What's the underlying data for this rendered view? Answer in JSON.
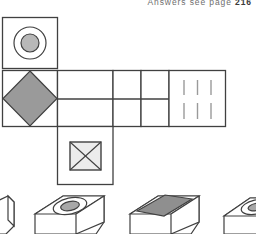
{
  "header": {
    "answer_key_text": "Answers  see  page",
    "answer_key_page": "216"
  },
  "puzzle": {
    "type": "cube-net-folding",
    "net": {
      "description": "Unfolded cube net made of squares on a grid",
      "stroke_color": "#404040",
      "cells": [
        {
          "id": "top-square",
          "data_name": "net-cell-circles",
          "x": 2,
          "y": 17,
          "w": 56,
          "h": 51,
          "face_symbol": "concentric-circles",
          "symbol_fill": "#b8b8b8"
        },
        {
          "id": "left-square",
          "data_name": "net-cell-diamond",
          "x": 2,
          "y": 70,
          "w": 56,
          "h": 57,
          "face_symbol": "filled-diamond",
          "symbol_fill": "#9a9a9a"
        },
        {
          "id": "mid-wide-1",
          "data_name": "net-cell-blank-wide",
          "x": 58,
          "y": 70,
          "w": 55,
          "h": 57,
          "face_symbol": "blank",
          "symbol_fill": "none"
        },
        {
          "id": "mid-2",
          "data_name": "net-cell-blank-a",
          "x": 113,
          "y": 70,
          "w": 28,
          "h": 57,
          "face_symbol": "blank",
          "symbol_fill": "none"
        },
        {
          "id": "mid-3",
          "data_name": "net-cell-blank-b",
          "x": 141,
          "y": 70,
          "w": 28,
          "h": 57,
          "face_symbol": "blank",
          "symbol_fill": "none"
        },
        {
          "id": "right-square",
          "data_name": "net-cell-stripes",
          "x": 169,
          "y": 70,
          "w": 57,
          "h": 57,
          "face_symbol": "three-vertical-lines",
          "symbol_fill": "#9a9a9a"
        },
        {
          "id": "bottom-square",
          "data_name": "net-cell-crossed-square",
          "x": 58,
          "y": 127,
          "w": 55,
          "h": 58,
          "face_symbol": "square-with-x",
          "symbol_fill": "#ececec"
        }
      ],
      "internal_divider": {
        "data_name": "net-horizontal-divider",
        "x1": 58,
        "y1": 99,
        "x2": 169,
        "y2": 99
      }
    },
    "options": [
      {
        "id": "option-a",
        "data_name": "answer-option-a",
        "label": "",
        "face_symbol": "partial-cut-off",
        "visible": "partial-left-edge"
      },
      {
        "id": "option-b",
        "data_name": "answer-option-b",
        "label": "",
        "face_symbol": "concentric-ellipses",
        "symbol_fill": "#a8a8a8",
        "visible": "full"
      },
      {
        "id": "option-c",
        "data_name": "answer-option-c",
        "label": "",
        "face_symbol": "filled-parallelogram",
        "symbol_fill": "#8f8f8f",
        "visible": "full"
      },
      {
        "id": "option-d",
        "data_name": "answer-option-d",
        "label": "",
        "face_symbol": "concentric-ellipses",
        "symbol_fill": "#a8a8a8",
        "visible": "partial-right-edge"
      }
    ]
  },
  "colors": {
    "line": "#404040",
    "line_light": "#9a9a9a",
    "diamond_fill": "#9a9a9a",
    "circle_fill": "#b8b8b8",
    "crossed_square_fill": "#ececec",
    "page_bg": "#ffffff",
    "text_gray": "#6e6e6e"
  }
}
